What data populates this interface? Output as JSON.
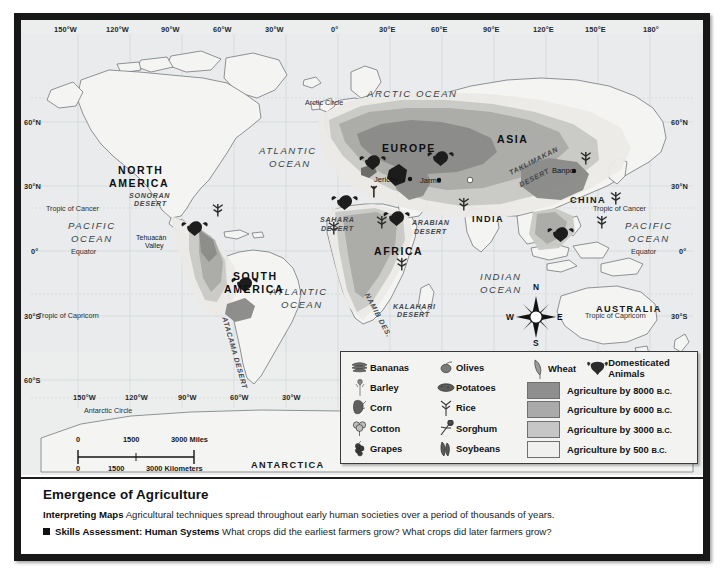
{
  "map": {
    "title": "Emergence of Agriculture",
    "projection_note": "Miller Cylindrical Projection",
    "longitude_labels": [
      "150°W",
      "120°W",
      "90°W",
      "60°W",
      "30°W",
      "0°",
      "30°E",
      "60°E",
      "90°E",
      "120°E",
      "150°E",
      "180°"
    ],
    "longitude_labels_bottom": [
      "150°W",
      "120°W",
      "90°W",
      "60°W",
      "30°W"
    ],
    "latitude_labels_left": [
      "60°N",
      "30°N",
      "0°",
      "30°S",
      "60°S"
    ],
    "latitude_labels_right": [
      "60°N",
      "30°N",
      "0°",
      "30°S"
    ],
    "reference_lines": [
      "Arctic Circle",
      "Tropic of Cancer",
      "Equator",
      "Tropic of Capricorn",
      "Antarctic Circle"
    ],
    "continents": [
      "NORTH AMERICA",
      "SOUTH AMERICA",
      "EUROPE",
      "ASIA",
      "AFRICA",
      "AUSTRALIA",
      "ANTARCTICA",
      "INDIA",
      "CHINA"
    ],
    "oceans": [
      "ARCTIC OCEAN",
      "ATLANTIC OCEAN",
      "PACIFIC OCEAN",
      "INDIAN OCEAN"
    ],
    "deserts": [
      "SONORAN DESERT",
      "ATACAMA DESERT",
      "SAHARA DESERT",
      "ARABIAN DESERT",
      "NAMIB DES.",
      "KALAHARI DESERT",
      "TAKLIMAKAN DESERT"
    ],
    "cities": [
      "Jericho",
      "Jarmo",
      "Banpo"
    ],
    "places": [
      "Tehuacán Valley"
    ],
    "labels": {
      "north_america": "NORTH\nAMERICA",
      "north_america_l1": "NORTH",
      "north_america_l2": "AMERICA",
      "south_america_l1": "SOUTH",
      "south_america_l2": "AMERICA",
      "europe": "EUROPE",
      "asia": "ASIA",
      "africa": "AFRICA",
      "australia": "AUSTRALIA",
      "antarctica": "ANTARCTICA",
      "india": "INDIA",
      "china": "CHINA",
      "arctic_ocean": "ARCTIC  OCEAN",
      "atlantic_ocean_n_l1": "ATLANTIC",
      "atlantic_ocean_n_l2": "OCEAN",
      "atlantic_ocean_s_l1": "ATLANTIC",
      "atlantic_ocean_s_l2": "OCEAN",
      "pacific_ocean_w_l1": "PACIFIC",
      "pacific_ocean_w_l2": "OCEAN",
      "pacific_ocean_e_l1": "PACIFIC",
      "pacific_ocean_e_l2": "OCEAN",
      "indian_ocean_l1": "INDIAN",
      "indian_ocean_l2": "OCEAN",
      "sonoran_l1": "SONORAN",
      "sonoran_l2": "DESERT",
      "sahara_l1": "SAHARA",
      "sahara_l2": "DESERT",
      "arabian_l1": "ARABIAN",
      "arabian_l2": "DESERT",
      "kalahari_l1": "KALAHARI",
      "kalahari_l2": "DESERT",
      "namib": "NAMIB DES.",
      "atacama": "ATACAMA DESERT",
      "taklimakan_l1": "TAKLIMAKAN",
      "taklimakan_l2": "DESERT",
      "tehuacan_l1": "Tehuacán",
      "tehuacan_l2": "Valley",
      "jericho": "Jericho",
      "jarmo": "Jarmo",
      "banpo": "Banpo",
      "arctic_circle": "Arctic Circle",
      "antarctic_circle": "Antarctic Circle",
      "tropic_cancer_left": "Tropic of Cancer",
      "tropic_cancer_right": "Tropic of Cancer",
      "tropic_capricorn_left": "Tropic of Capricorn",
      "tropic_capricorn_right": "Tropic of Capricorn",
      "equator_left": "Equator",
      "equator_right": "Equator"
    },
    "compass": {
      "n": "N",
      "e": "E",
      "s": "S",
      "w": "W"
    },
    "scale": {
      "miles": [
        "0",
        "1500",
        "3000 Miles"
      ],
      "kilometers": [
        "0",
        "1500",
        "3000 Kilometers"
      ],
      "miles_0": "0",
      "miles_1500": "1500",
      "miles_3000": "3000 Miles",
      "km_0": "0",
      "km_1500": "1500",
      "km_3000": "3000 Kilometers"
    }
  },
  "legend": {
    "crops_col1": [
      {
        "label": "Bananas",
        "icon": "banana-icon"
      },
      {
        "label": "Barley",
        "icon": "barley-icon"
      },
      {
        "label": "Corn",
        "icon": "corn-icon"
      },
      {
        "label": "Cotton",
        "icon": "cotton-icon"
      },
      {
        "label": "Grapes",
        "icon": "grapes-icon"
      }
    ],
    "crops_col2": [
      {
        "label": "Olives",
        "icon": "olive-icon"
      },
      {
        "label": "Potatoes",
        "icon": "potato-icon"
      },
      {
        "label": "Rice",
        "icon": "rice-icon"
      },
      {
        "label": "Sorghum",
        "icon": "sorghum-icon"
      },
      {
        "label": "Soybeans",
        "icon": "soybean-icon"
      }
    ],
    "col3_top": [
      {
        "label": "Wheat",
        "icon": "wheat-icon"
      },
      {
        "label_line1": "Domesticated",
        "label_line2": "Animals",
        "icon": "domesticated-animals-icon"
      }
    ],
    "agriculture_periods": [
      {
        "label": "Agriculture by 8000",
        "era": "B.C.",
        "color": "#8e8e8e"
      },
      {
        "label": "Agriculture by 6000",
        "era": "B.C.",
        "color": "#aaaaaa"
      },
      {
        "label": "Agriculture by 3000",
        "era": "B.C.",
        "color": "#c6c6c6"
      },
      {
        "label": "Agriculture by 500",
        "era": "B.C.",
        "color": "#f0f0ee"
      }
    ]
  },
  "caption": {
    "title": "Emergence of Agriculture",
    "line1_bold": "Interpreting Maps",
    "line1_text": "Agricultural techniques spread throughout early human societies over a period of thousands of years.",
    "line2_bold": "Skills Assessment: Human Systems",
    "line2_text": "What crops did the earliest farmers grow? What crops did later farmers grow?"
  },
  "colors": {
    "ocean": "#eceeee",
    "land": "#f4f4f2",
    "frame": "#171717",
    "agri_8000": "#8e8e8e",
    "agri_6000": "#aaaaaa",
    "agri_3000": "#c6c6c6",
    "agri_500": "#f0f0ee"
  }
}
